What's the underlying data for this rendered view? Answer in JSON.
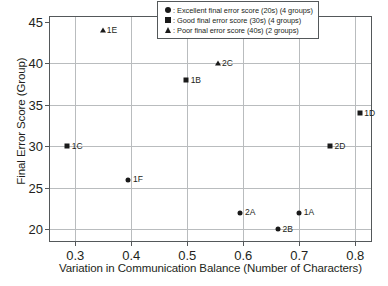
{
  "chart_data": {
    "type": "scatter",
    "title": "",
    "xlabel": "Variation in Communication Balance (Number of Characters)",
    "ylabel": "Final Error Score (Group)",
    "xlim": [
      0.255,
      0.828
    ],
    "ylim": [
      18.6,
      45.6
    ],
    "xticks": [
      "0.3",
      "0.4",
      "0.5",
      "0.6",
      "0.7",
      "0.8"
    ],
    "xtick_values": [
      0.3,
      0.4,
      0.5,
      0.6,
      0.7,
      0.8
    ],
    "yticks": [
      "20",
      "25",
      "30",
      "35",
      "40",
      "45"
    ],
    "ytick_values": [
      20,
      25,
      30,
      35,
      40,
      45
    ],
    "grid": true,
    "legend_position": "top-right",
    "series": [
      {
        "name": "Excellent final error score (20s) (4 groups)",
        "marker": "circle",
        "points": [
          {
            "label": "1F",
            "x": 0.395,
            "y": 26
          },
          {
            "label": "2A",
            "x": 0.595,
            "y": 22
          },
          {
            "label": "1A",
            "x": 0.7,
            "y": 22
          },
          {
            "label": "2B",
            "x": 0.662,
            "y": 20
          }
        ]
      },
      {
        "name": "Good final error score (30s) (4 groups)",
        "marker": "square",
        "points": [
          {
            "label": "1C",
            "x": 0.286,
            "y": 30
          },
          {
            "label": "1B",
            "x": 0.498,
            "y": 38
          },
          {
            "label": "2D",
            "x": 0.755,
            "y": 30
          },
          {
            "label": "1D",
            "x": 0.808,
            "y": 34
          }
        ]
      },
      {
        "name": "Poor final error score (40s) (2 groups)",
        "marker": "triangle",
        "points": [
          {
            "label": "1E",
            "x": 0.349,
            "y": 44
          },
          {
            "label": "2C",
            "x": 0.555,
            "y": 40
          }
        ]
      }
    ],
    "legend": [
      {
        "marker": "circle",
        "text": ": Excellent final error score (20s) (4 groups)"
      },
      {
        "marker": "square",
        "text": ": Good final error score (30s) (4 groups)"
      },
      {
        "marker": "triangle",
        "text": ": Poor final error score (40s) (2 groups)"
      }
    ]
  }
}
